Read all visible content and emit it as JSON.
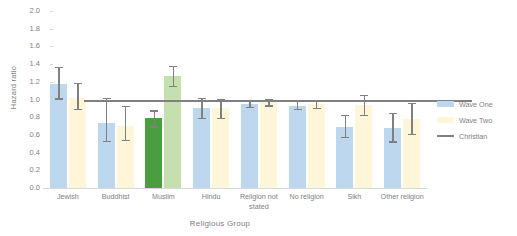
{
  "chart_data": {
    "type": "bar",
    "title": "",
    "xlabel": "Religious Group",
    "ylabel": "Hazard ratio",
    "ylim": [
      0.0,
      2.0
    ],
    "ytick_step": 0.2,
    "yticks": [
      "0.0",
      "0.2",
      "0.4",
      "0.6",
      "0.8",
      "1.0",
      "1.2",
      "1.4",
      "1.6",
      "1.8",
      "2.0"
    ],
    "grid": false,
    "legend_position": "right",
    "categories": [
      "Jewish",
      "Buddhist",
      "Muslim",
      "Hindu",
      "Religion not stated",
      "No religion",
      "Sikh",
      "Other religion"
    ],
    "series": [
      {
        "name": "Wave One",
        "color": "#bdd7ee",
        "highlight_color": "#4a9e3f",
        "values": [
          1.17,
          0.74,
          0.79,
          0.9,
          0.95,
          0.93,
          0.69,
          0.68
        ],
        "ci_lower": [
          1.0,
          0.52,
          0.68,
          0.78,
          0.9,
          0.88,
          0.56,
          0.51
        ],
        "ci_upper": [
          1.37,
          1.02,
          0.88,
          1.02,
          1.0,
          0.99,
          0.83,
          0.85
        ]
      },
      {
        "name": "Wave Two",
        "color": "#fdf6d8",
        "highlight_color": "#c5dfae",
        "values": [
          1.02,
          0.7,
          1.27,
          0.9,
          0.97,
          0.95,
          0.94,
          0.78
        ],
        "ci_lower": [
          0.88,
          0.53,
          1.14,
          0.78,
          0.92,
          0.89,
          0.81,
          0.6
        ],
        "ci_upper": [
          1.19,
          0.93,
          1.38,
          1.01,
          1.01,
          1.0,
          1.05,
          0.96
        ]
      }
    ],
    "highlighted_category": "Muslim",
    "reference_line": {
      "label": "Christian",
      "value": 1.0,
      "color": "#808080"
    },
    "legend": [
      {
        "label": "Wave One",
        "color": "#bdd7ee",
        "marker": "swatch"
      },
      {
        "label": "Wave Two",
        "color": "#fdf6d8",
        "marker": "swatch"
      },
      {
        "label": "Christian",
        "color": "#808080",
        "marker": "line"
      }
    ]
  }
}
